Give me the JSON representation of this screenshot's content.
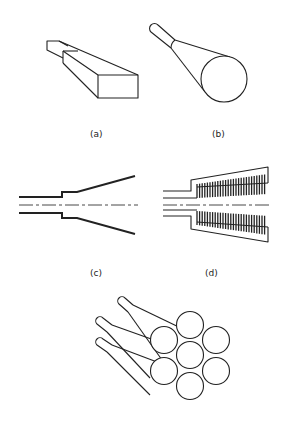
{
  "figure": {
    "panels": [
      {
        "id": "a",
        "label": "(a)",
        "description": "tapered rectangular waveguide / bar"
      },
      {
        "id": "b",
        "label": "(b)",
        "description": "tapered cylindrical fiber cone"
      },
      {
        "id": "c",
        "label": "(c)",
        "description": "smooth-wall conical horn cross-section"
      },
      {
        "id": "d",
        "label": "(d)",
        "description": "corrugated conical horn cross-section"
      },
      {
        "id": "e",
        "label": "",
        "description": "bundle of seven tapered fibers in hexagonal packing"
      }
    ],
    "colors": {
      "line": "#222222",
      "background": "#ffffff"
    }
  }
}
